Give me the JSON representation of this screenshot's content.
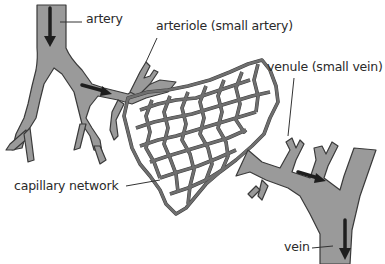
{
  "diagram": {
    "labels": {
      "artery": "artery",
      "arteriole": "arteriole (small artery)",
      "venule": "venule (small vein)",
      "capillary_network": "capillary network",
      "vein": "vein"
    },
    "arrows": [
      {
        "name": "artery-flow-arrow",
        "direction": "down"
      },
      {
        "name": "arteriole-flow-arrow",
        "direction": "right"
      },
      {
        "name": "venule-flow-arrow",
        "direction": "right"
      },
      {
        "name": "vein-flow-arrow",
        "direction": "down"
      }
    ],
    "colors": {
      "vessel_fill": "#9a9a9a",
      "vessel_outline": "#3a3a3a",
      "arrow": "#1e1e1e",
      "text": "#2a2a2a",
      "background": "#ffffff"
    }
  }
}
